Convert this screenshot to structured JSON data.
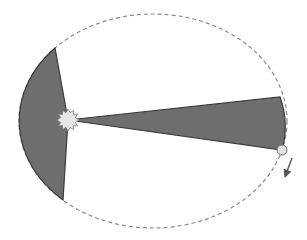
{
  "diagram": {
    "colors": {
      "background": "#ffffff",
      "orbit": "#8a8a8a",
      "sector_fill": "#6e6e6e",
      "sector_stroke": "#3a3a3a",
      "sun_fill": "#e6e6e6",
      "sun_stroke": "#777777",
      "planet_fill": "#e2e2e2",
      "planet_stroke": "#777777",
      "arrow": "#555555"
    },
    "orbit": {
      "cx": 153,
      "cy": 121,
      "rx": 134,
      "ry": 107,
      "style": "dashed"
    },
    "sun": {
      "x": 68,
      "y": 120,
      "r": 9
    },
    "planet": {
      "x": 282,
      "y": 150,
      "r": 5
    },
    "sectors": [
      {
        "name": "aphelion-side-sector",
        "from": [
          55,
          48
        ],
        "to": [
          63,
          200
        ]
      },
      {
        "name": "perihelion-side-sector",
        "from": [
          280,
          97
        ],
        "to": [
          282,
          150
        ]
      }
    ],
    "motion_arrow": {
      "from": [
        292,
        158
      ],
      "to": [
        285,
        176
      ],
      "direction": "clockwise-down"
    }
  }
}
